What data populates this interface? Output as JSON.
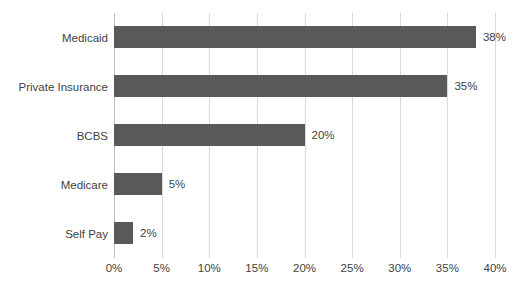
{
  "chart_data": {
    "type": "bar",
    "orientation": "horizontal",
    "title": "",
    "xlabel": "",
    "ylabel": "",
    "categories": [
      "Medicaid",
      "Private Insurance",
      "BCBS",
      "Medicare",
      "Self Pay"
    ],
    "values": [
      38,
      35,
      20,
      5,
      2
    ],
    "data_labels": [
      "38%",
      "35%",
      "20%",
      "5%",
      "2%"
    ],
    "xlim": [
      0,
      40
    ],
    "xticks": [
      0,
      5,
      10,
      15,
      20,
      25,
      30,
      35,
      40
    ],
    "xtick_labels": [
      "0%",
      "5%",
      "10%",
      "15%",
      "20%",
      "25%",
      "30%",
      "35%",
      "40%"
    ],
    "grid": "vertical",
    "legend": "none",
    "bar_color": "#595959",
    "gridline_color": "#d9d9d9",
    "text_color": "#3f3f3f",
    "background_color": "#ffffff"
  }
}
